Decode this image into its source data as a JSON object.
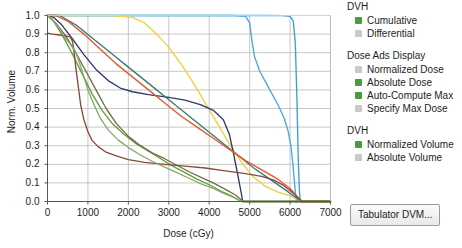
{
  "chart_data": {
    "type": "line",
    "title": "",
    "xlabel": "Dose (cGy)",
    "ylabel": "Norm. Volume",
    "xlim": [
      0,
      7000
    ],
    "ylim": [
      0,
      1.0
    ],
    "xticks": [
      0,
      1000,
      2000,
      3000,
      4000,
      5000,
      6000,
      7000
    ],
    "yticks": [
      "0.0",
      "0.1",
      "0.2",
      "0.3",
      "0.4",
      "0.5",
      "0.6",
      "0.7",
      "0.8",
      "0.9",
      "1.0"
    ],
    "grid": true,
    "legend": "none",
    "series": [
      {
        "name": "ptv-target",
        "color": "#3d9fd6",
        "points": [
          [
            0,
            1.0
          ],
          [
            500,
            1.0
          ],
          [
            1500,
            1.0
          ],
          [
            2500,
            1.0
          ],
          [
            3500,
            1.0
          ],
          [
            4500,
            1.0
          ],
          [
            5400,
            1.0
          ],
          [
            5800,
            0.999
          ],
          [
            6000,
            0.995
          ],
          [
            6080,
            0.97
          ],
          [
            6130,
            0.85
          ],
          [
            6170,
            0.55
          ],
          [
            6200,
            0.25
          ],
          [
            6230,
            0.06
          ],
          [
            6250,
            0.0
          ],
          [
            7000,
            0.0
          ]
        ]
      },
      {
        "name": "ctv-structure",
        "color": "#4aa8e0",
        "points": [
          [
            0,
            1.0
          ],
          [
            1000,
            1.0
          ],
          [
            2500,
            1.0
          ],
          [
            3800,
            1.0
          ],
          [
            4600,
            1.0
          ],
          [
            4900,
            0.995
          ],
          [
            5000,
            0.96
          ],
          [
            5060,
            0.86
          ],
          [
            5120,
            0.78
          ],
          [
            5250,
            0.7
          ],
          [
            5500,
            0.6
          ],
          [
            5700,
            0.52
          ],
          [
            5850,
            0.45
          ],
          [
            5950,
            0.38
          ],
          [
            6020,
            0.3
          ],
          [
            6070,
            0.2
          ],
          [
            6110,
            0.1
          ],
          [
            6140,
            0.03
          ],
          [
            6160,
            0.0
          ],
          [
            7000,
            0.0
          ]
        ]
      },
      {
        "name": "bladder",
        "color": "#f2d03c",
        "points": [
          [
            0,
            1.0
          ],
          [
            800,
            1.0
          ],
          [
            1600,
            1.0
          ],
          [
            2100,
            0.99
          ],
          [
            2400,
            0.96
          ],
          [
            2700,
            0.9
          ],
          [
            3000,
            0.83
          ],
          [
            3300,
            0.74
          ],
          [
            3600,
            0.64
          ],
          [
            3900,
            0.53
          ],
          [
            4200,
            0.42
          ],
          [
            4500,
            0.31
          ],
          [
            4800,
            0.21
          ],
          [
            5100,
            0.13
          ],
          [
            5400,
            0.08
          ],
          [
            5700,
            0.05
          ],
          [
            6000,
            0.03
          ],
          [
            6200,
            0.01
          ],
          [
            6350,
            0.0
          ],
          [
            7000,
            0.0
          ]
        ]
      },
      {
        "name": "rectum",
        "color": "#2b3a6b",
        "points": [
          [
            0,
            1.0
          ],
          [
            150,
            0.99
          ],
          [
            350,
            0.95
          ],
          [
            600,
            0.88
          ],
          [
            900,
            0.79
          ],
          [
            1200,
            0.71
          ],
          [
            1500,
            0.65
          ],
          [
            1800,
            0.61
          ],
          [
            2100,
            0.59
          ],
          [
            2500,
            0.575
          ],
          [
            3000,
            0.56
          ],
          [
            3400,
            0.545
          ],
          [
            3800,
            0.52
          ],
          [
            4100,
            0.49
          ],
          [
            4350,
            0.44
          ],
          [
            4500,
            0.36
          ],
          [
            4600,
            0.26
          ],
          [
            4700,
            0.15
          ],
          [
            4780,
            0.06
          ],
          [
            4830,
            0.0
          ],
          [
            7000,
            0.0
          ]
        ]
      },
      {
        "name": "femoral-head-left",
        "color": "#3a7a7a",
        "points": [
          [
            0,
            1.0
          ],
          [
            300,
            1.0
          ],
          [
            700,
            0.95
          ],
          [
            1100,
            0.88
          ],
          [
            1500,
            0.81
          ],
          [
            1900,
            0.74
          ],
          [
            2300,
            0.67
          ],
          [
            2700,
            0.6
          ],
          [
            3100,
            0.53
          ],
          [
            3500,
            0.46
          ],
          [
            3900,
            0.39
          ],
          [
            4300,
            0.32
          ],
          [
            4700,
            0.25
          ],
          [
            5100,
            0.18
          ],
          [
            5500,
            0.12
          ],
          [
            5900,
            0.06
          ],
          [
            6150,
            0.02
          ],
          [
            6280,
            0.0
          ],
          [
            7000,
            0.0
          ]
        ]
      },
      {
        "name": "femoral-head-right",
        "color": "#e4582a",
        "points": [
          [
            0,
            1.0
          ],
          [
            200,
            1.0
          ],
          [
            500,
            0.97
          ],
          [
            900,
            0.9
          ],
          [
            1300,
            0.82
          ],
          [
            1700,
            0.74
          ],
          [
            2100,
            0.67
          ],
          [
            2500,
            0.6
          ],
          [
            2900,
            0.53
          ],
          [
            3300,
            0.46
          ],
          [
            3700,
            0.4
          ],
          [
            4100,
            0.34
          ],
          [
            4500,
            0.28
          ],
          [
            4900,
            0.22
          ],
          [
            5300,
            0.17
          ],
          [
            5700,
            0.12
          ],
          [
            6000,
            0.07
          ],
          [
            6200,
            0.02
          ],
          [
            6300,
            0.0
          ],
          [
            7000,
            0.0
          ]
        ]
      },
      {
        "name": "bowel",
        "color": "#5aa23c",
        "points": [
          [
            0,
            1.0
          ],
          [
            150,
            0.97
          ],
          [
            350,
            0.9
          ],
          [
            600,
            0.8
          ],
          [
            850,
            0.69
          ],
          [
            1100,
            0.58
          ],
          [
            1350,
            0.49
          ],
          [
            1600,
            0.42
          ],
          [
            1900,
            0.36
          ],
          [
            2200,
            0.31
          ],
          [
            2500,
            0.27
          ],
          [
            2800,
            0.23
          ],
          [
            3100,
            0.19
          ],
          [
            3400,
            0.155
          ],
          [
            3700,
            0.12
          ],
          [
            4000,
            0.09
          ],
          [
            4300,
            0.055
          ],
          [
            4550,
            0.03
          ],
          [
            4750,
            0.005
          ],
          [
            4830,
            0.0
          ],
          [
            7000,
            0.0
          ]
        ]
      },
      {
        "name": "body-contour",
        "color": "#7a6a4a",
        "points": [
          [
            0,
            1.0
          ],
          [
            200,
            0.96
          ],
          [
            450,
            0.89
          ],
          [
            700,
            0.8
          ],
          [
            950,
            0.7
          ],
          [
            1200,
            0.6
          ],
          [
            1450,
            0.5
          ],
          [
            1700,
            0.42
          ],
          [
            2000,
            0.35
          ],
          [
            2300,
            0.3
          ],
          [
            2600,
            0.26
          ],
          [
            2900,
            0.23
          ],
          [
            3200,
            0.195
          ],
          [
            3500,
            0.16
          ],
          [
            3800,
            0.13
          ],
          [
            4100,
            0.1
          ],
          [
            4400,
            0.065
          ],
          [
            4650,
            0.035
          ],
          [
            4800,
            0.008
          ],
          [
            4870,
            0.0
          ],
          [
            7000,
            0.0
          ]
        ]
      },
      {
        "name": "spinal-cord",
        "color": "#8a4a3a",
        "points": [
          [
            0,
            0.905
          ],
          [
            120,
            0.9
          ],
          [
            300,
            0.895
          ],
          [
            450,
            0.89
          ],
          [
            560,
            0.885
          ],
          [
            620,
            0.86
          ],
          [
            660,
            0.8
          ],
          [
            700,
            0.72
          ],
          [
            760,
            0.62
          ],
          [
            820,
            0.52
          ],
          [
            900,
            0.44
          ],
          [
            1000,
            0.375
          ],
          [
            1100,
            0.33
          ],
          [
            1250,
            0.295
          ],
          [
            1450,
            0.265
          ],
          [
            1700,
            0.245
          ],
          [
            2000,
            0.225
          ],
          [
            2400,
            0.21
          ],
          [
            2900,
            0.2
          ],
          [
            3400,
            0.19
          ],
          [
            3900,
            0.18
          ],
          [
            4400,
            0.165
          ],
          [
            4900,
            0.15
          ],
          [
            5300,
            0.135
          ],
          [
            5600,
            0.115
          ],
          [
            5850,
            0.085
          ],
          [
            6050,
            0.05
          ],
          [
            6200,
            0.02
          ],
          [
            6300,
            0.0
          ],
          [
            7000,
            0.0
          ]
        ]
      },
      {
        "name": "normal-tissue",
        "color": "#8aa86a",
        "points": [
          [
            0,
            1.0
          ],
          [
            100,
            0.985
          ],
          [
            250,
            0.94
          ],
          [
            400,
            0.89
          ],
          [
            550,
            0.85
          ],
          [
            650,
            0.82
          ],
          [
            720,
            0.79
          ],
          [
            800,
            0.74
          ],
          [
            900,
            0.67
          ],
          [
            1000,
            0.6
          ],
          [
            1150,
            0.52
          ],
          [
            1300,
            0.45
          ],
          [
            1500,
            0.385
          ],
          [
            1750,
            0.33
          ],
          [
            2000,
            0.29
          ],
          [
            2300,
            0.25
          ],
          [
            2600,
            0.215
          ],
          [
            2900,
            0.185
          ],
          [
            3200,
            0.155
          ],
          [
            3500,
            0.125
          ],
          [
            3800,
            0.095
          ],
          [
            4100,
            0.07
          ],
          [
            4400,
            0.04
          ],
          [
            4650,
            0.018
          ],
          [
            4800,
            0.0
          ],
          [
            7000,
            0.0
          ]
        ]
      }
    ]
  },
  "panel": {
    "groups": [
      {
        "title": "DVH",
        "options": [
          {
            "label": "Cumulative",
            "selected": true
          },
          {
            "label": "Differential",
            "selected": false
          }
        ]
      },
      {
        "title": "Dose Ads Display",
        "options": [
          {
            "label": "Normalized Dose",
            "selected": false
          },
          {
            "label": "Absolute Dose",
            "selected": true
          },
          {
            "label": "Auto-Compute Max",
            "selected": true
          },
          {
            "label": "Specify Max Dose",
            "selected": false
          }
        ]
      },
      {
        "title": "DVH",
        "options": [
          {
            "label": "Normalized Volume",
            "selected": true
          },
          {
            "label": "Absolute Volume",
            "selected": false
          }
        ]
      }
    ],
    "tabulator_button": "Tabulator DVM..."
  },
  "colors": {
    "selected_swatch": "#4a9b3c",
    "unselected_swatch": "#c9c9c9",
    "grid": "#b9b9b9",
    "axis": "#555555"
  }
}
